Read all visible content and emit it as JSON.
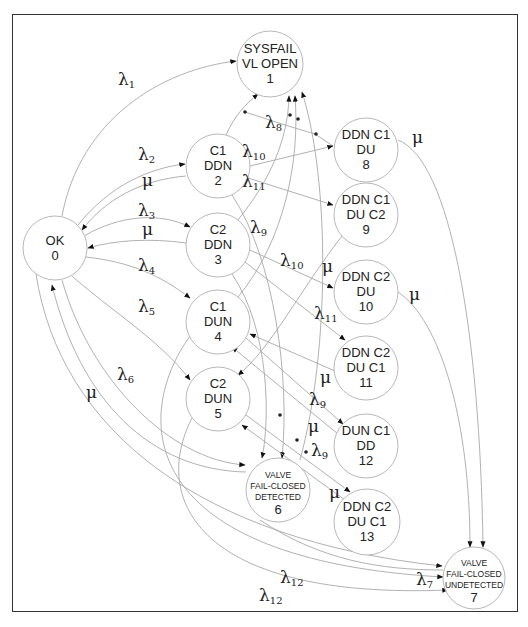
{
  "diagram": {
    "type": "markov-state-transition",
    "nodes": [
      {
        "id": "1",
        "lines": [
          "SYSFAIL",
          "VL OPEN",
          "1"
        ],
        "cx": 270,
        "cy": 64,
        "r": 33,
        "small": false
      },
      {
        "id": "2",
        "lines": [
          "C1",
          "DDN",
          "2"
        ],
        "cx": 218,
        "cy": 166,
        "r": 32,
        "small": false
      },
      {
        "id": "0",
        "lines": [
          "OK",
          "0"
        ],
        "cx": 55,
        "cy": 248,
        "r": 32,
        "small": false
      },
      {
        "id": "3",
        "lines": [
          "C2",
          "DDN",
          "3"
        ],
        "cx": 218,
        "cy": 245,
        "r": 32,
        "small": false
      },
      {
        "id": "4",
        "lines": [
          "C1",
          "DUN",
          "4"
        ],
        "cx": 218,
        "cy": 322,
        "r": 32,
        "small": false
      },
      {
        "id": "5",
        "lines": [
          "C2",
          "DUN",
          "5"
        ],
        "cx": 218,
        "cy": 399,
        "r": 32,
        "small": false
      },
      {
        "id": "8",
        "lines": [
          "DDN C1",
          "DU",
          "8"
        ],
        "cx": 366,
        "cy": 150,
        "r": 32,
        "small": false
      },
      {
        "id": "9",
        "lines": [
          "DDN C1",
          "DU C2",
          "9"
        ],
        "cx": 366,
        "cy": 215,
        "r": 32,
        "small": false
      },
      {
        "id": "10",
        "lines": [
          "DDN C2",
          "DU",
          "10"
        ],
        "cx": 366,
        "cy": 292,
        "r": 32,
        "small": false
      },
      {
        "id": "11",
        "lines": [
          "DDN C2",
          "DU C1",
          "11"
        ],
        "cx": 366,
        "cy": 368,
        "r": 32,
        "small": false
      },
      {
        "id": "12",
        "lines": [
          "DUN C1",
          "DD",
          "12"
        ],
        "cx": 366,
        "cy": 446,
        "r": 32,
        "small": false
      },
      {
        "id": "6",
        "lines": [
          "VALVE",
          "FAIL-CLOSED",
          "DETECTED",
          "6"
        ],
        "cx": 278,
        "cy": 490,
        "r": 32,
        "small": true
      },
      {
        "id": "13",
        "lines": [
          "DDN C2",
          "DU C1",
          "13"
        ],
        "cx": 367,
        "cy": 522,
        "r": 33,
        "small": false
      },
      {
        "id": "7",
        "lines": [
          "VALVE",
          "FAIL-CLOSED",
          "UNDETECTED",
          "7"
        ],
        "cx": 474,
        "cy": 578,
        "r": 31,
        "small": true
      }
    ],
    "labels": [
      {
        "sym": "λ",
        "sub": "1",
        "x": 118,
        "y": 85
      },
      {
        "sym": "λ",
        "sub": "2",
        "x": 138,
        "y": 160
      },
      {
        "sym": "μ",
        "sub": "",
        "x": 142,
        "y": 186
      },
      {
        "sym": "λ",
        "sub": "3",
        "x": 138,
        "y": 216
      },
      {
        "sym": "μ",
        "sub": "",
        "x": 142,
        "y": 235
      },
      {
        "sym": "λ",
        "sub": "4",
        "x": 138,
        "y": 271
      },
      {
        "sym": "λ",
        "sub": "5",
        "x": 138,
        "y": 312
      },
      {
        "sym": "λ",
        "sub": "6",
        "x": 117,
        "y": 380
      },
      {
        "sym": "μ",
        "sub": "",
        "x": 86,
        "y": 398
      },
      {
        "sym": "λ",
        "sub": "8",
        "x": 265,
        "y": 128
      },
      {
        "sym": "λ",
        "sub": "10",
        "x": 242,
        "y": 157
      },
      {
        "sym": "λ",
        "sub": "11",
        "x": 242,
        "y": 187
      },
      {
        "sym": "λ",
        "sub": "9",
        "x": 250,
        "y": 233
      },
      {
        "sym": "μ",
        "sub": "",
        "x": 412,
        "y": 143
      },
      {
        "sym": "λ",
        "sub": "10",
        "x": 280,
        "y": 266
      },
      {
        "sym": "μ",
        "sub": "",
        "x": 322,
        "y": 272
      },
      {
        "sym": "μ",
        "sub": "",
        "x": 409,
        "y": 300
      },
      {
        "sym": "λ",
        "sub": "11",
        "x": 314,
        "y": 319
      },
      {
        "sym": "μ",
        "sub": "",
        "x": 320,
        "y": 383
      },
      {
        "sym": "λ",
        "sub": "9",
        "x": 309,
        "y": 405
      },
      {
        "sym": "μ",
        "sub": "",
        "x": 308,
        "y": 432
      },
      {
        "sym": "λ",
        "sub": "9",
        "x": 311,
        "y": 456
      },
      {
        "sym": "μ",
        "sub": "",
        "x": 329,
        "y": 498
      },
      {
        "sym": "λ",
        "sub": "12",
        "x": 280,
        "y": 583
      },
      {
        "sym": "λ",
        "sub": "7",
        "x": 416,
        "y": 585
      },
      {
        "sym": "λ",
        "sub": "12",
        "x": 259,
        "y": 601
      }
    ]
  }
}
